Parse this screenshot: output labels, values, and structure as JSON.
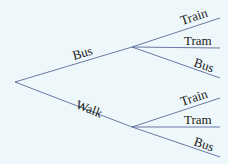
{
  "diagram": {
    "type": "probability-tree",
    "background": "#eef8fb",
    "line_color": "#5a6a9a",
    "first_stage": [
      {
        "label": "Bus",
        "second_stage": [
          "Train",
          "Tram",
          "Bus"
        ]
      },
      {
        "label": "Walk",
        "second_stage": [
          "Train",
          "Tram",
          "Bus"
        ]
      }
    ]
  }
}
